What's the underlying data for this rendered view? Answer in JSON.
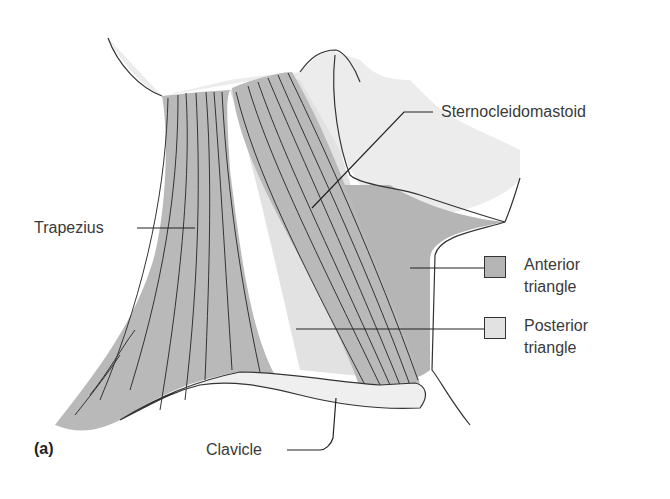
{
  "figure": {
    "panel_label": "(a)",
    "colors": {
      "background": "#ffffff",
      "head_skin": "#ececec",
      "muscle_fill": "#b9b9b9",
      "anterior_triangle": "#b5b5b5",
      "posterior_triangle": "#e2e2e2",
      "clavicle": "#efefef",
      "outline": "#333333"
    }
  },
  "labels": {
    "trapezius": "Trapezius",
    "sternocleidomastoid": "Sternocleidomastoid",
    "clavicle": "Clavicle"
  },
  "legend": {
    "items": [
      {
        "line1": "Anterior",
        "line2": "triangle",
        "color": "#b5b5b5"
      },
      {
        "line1": "Posterior",
        "line2": "triangle",
        "color": "#e2e2e2"
      }
    ]
  }
}
